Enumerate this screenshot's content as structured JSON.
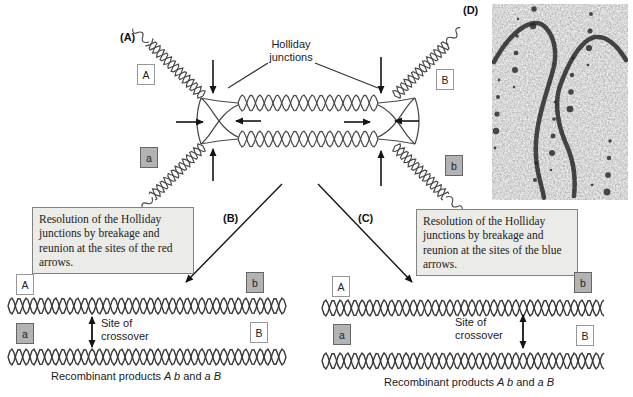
{
  "figure": {
    "panel_a_label": "(A)",
    "panel_b_label": "(B)",
    "panel_c_label": "(C)",
    "panel_d_label": "(D)"
  },
  "panel_a": {
    "holliday_junctions_label": "Holliday\njunctions",
    "allele_top_left": "A",
    "allele_top_right": "B",
    "allele_bottom_left": "a",
    "allele_bottom_right": "b"
  },
  "resolution_left": {
    "text": "Resolution of the Holliday junctions by breakage and reunion at the sites of the red arrows."
  },
  "resolution_right": {
    "text": "Resolution of the Holliday junctions by breakage and reunion at the sites of the blue arrows."
  },
  "product_left": {
    "allele_top_left": "A",
    "allele_top_right": "b",
    "allele_bottom_left": "a",
    "allele_bottom_right": "B",
    "crossover_label": "Site of\ncrossover",
    "caption_prefix": "Recombinant products",
    "caption_italic_1": "A b",
    "caption_conj": "and",
    "caption_italic_2": "a B"
  },
  "product_right": {
    "allele_top_left": "A",
    "allele_top_right": "b",
    "allele_bottom_left": "a",
    "allele_bottom_right": "B",
    "crossover_label": "Site of\ncrossover",
    "caption_prefix": "Recombinant products",
    "caption_italic_1": "A b",
    "caption_conj": "and",
    "caption_italic_2": "a B"
  },
  "colors": {
    "strand": "#4a4a4a",
    "strand_dark": "#383838",
    "arrow": "#141414",
    "pointer_line": "#333333",
    "recessive_box_bg": "#b3b3b3",
    "resolution_box_bg": "#ebebe8",
    "micrograph_bg": "#cfcfcf",
    "micrograph_strand": "#2e2e2e"
  }
}
